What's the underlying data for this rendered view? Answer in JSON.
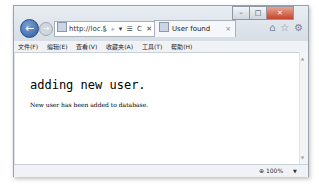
{
  "browser": {
    "address": "http://loc...",
    "address_tools": "§ ⌕ ▾ ☰ C ✕",
    "tab": {
      "title": "User found",
      "close": "×"
    },
    "window_controls": {
      "minimize": "–",
      "maximize": "□",
      "close": "✕"
    },
    "nav": {
      "back": "←",
      "forward": "→"
    },
    "right_icons": "⌂☆⚙"
  },
  "menu": {
    "items": [
      "文件(F)",
      "编辑(E)",
      "查看(V)",
      "收藏夹(A)",
      "工具(T)",
      "帮助(H)"
    ]
  },
  "page": {
    "heading": "adding new user.",
    "message": "New user has been added to database."
  },
  "status": {
    "zoom": "⊕ 100%",
    "dropdown": "▼"
  }
}
